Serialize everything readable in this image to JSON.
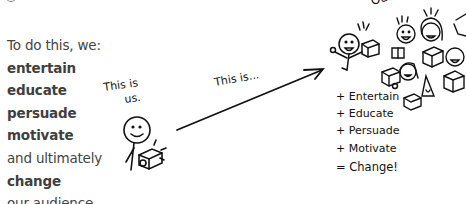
{
  "text_block": {
    "lines": [
      {
        "text": "To do this, we:",
        "style": "light"
      },
      {
        "text": "entertain",
        "style": "bold"
      },
      {
        "text": "educate",
        "style": "bold"
      },
      {
        "text": "persuade",
        "style": "bold"
      },
      {
        "text": "motivate",
        "style": "bold"
      },
      {
        "text": "and ultimately",
        "style": "light"
      },
      {
        "text": "change",
        "style": "bold"
      },
      {
        "text": "our audience.",
        "style": "light"
      }
    ]
  },
  "illustration": {
    "us_label_line1": "This is",
    "us_label_line2": "us.",
    "arrow_label": "This is...",
    "audience_label_partial": "Our",
    "equation": [
      "+ Entertain",
      "+ Educate",
      "+ Persuade",
      "+ Motivate",
      "= Change!"
    ]
  }
}
